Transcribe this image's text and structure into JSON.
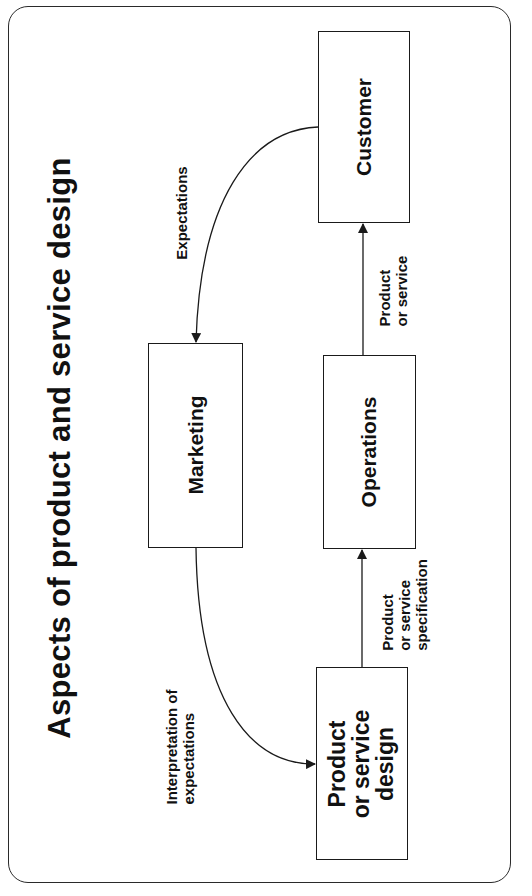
{
  "diagram": {
    "title": "Aspects of product and service design",
    "nodes": [
      {
        "id": "customer",
        "label": "Customer"
      },
      {
        "id": "marketing",
        "label": "Marketing"
      },
      {
        "id": "operations",
        "label": "Operations"
      },
      {
        "id": "design",
        "label_lines": [
          "Product",
          "or service",
          "design"
        ]
      }
    ],
    "edges": [
      {
        "from": "customer",
        "to": "marketing",
        "label": "Expectations"
      },
      {
        "from": "marketing",
        "to": "design",
        "label_lines": [
          "Interpretation of",
          "expectations"
        ]
      },
      {
        "from": "design",
        "to": "operations",
        "label_lines": [
          "Product",
          "or service",
          "specification"
        ]
      },
      {
        "from": "operations",
        "to": "customer",
        "label_lines": [
          "Product",
          "or service"
        ]
      }
    ],
    "colors": {
      "line": "#1a1a1a",
      "text": "#111111",
      "background": "#ffffff"
    }
  }
}
